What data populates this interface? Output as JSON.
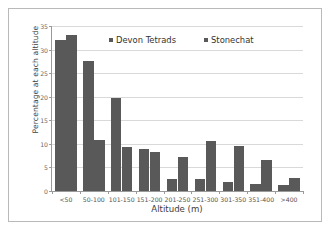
{
  "chart_data": {
    "type": "bar",
    "title": "",
    "subtitle": "",
    "xlabel": "Altitude (m)",
    "ylabel": "Percentage at each altitude",
    "categories": [
      "<50",
      "50-100",
      "101-150",
      "151-200",
      "201-250",
      "251-300",
      "301-350",
      "351-400",
      ">400"
    ],
    "series": [
      {
        "name": "Devon Tetrads",
        "color": "#595959",
        "values": [
          32.0,
          27.6,
          19.8,
          8.9,
          2.6,
          2.6,
          2.0,
          1.5,
          1.2
        ]
      },
      {
        "name": "Stonechat",
        "color": "#595959",
        "values": [
          33.0,
          10.8,
          9.3,
          8.2,
          7.2,
          10.6,
          9.6,
          6.5,
          2.7
        ]
      }
    ],
    "ylim": [
      0,
      35
    ],
    "yticks": [
      0,
      5,
      10,
      15,
      20,
      25,
      30,
      35
    ],
    "ytick_labels": [
      "0",
      "5",
      "10",
      "15",
      "20",
      "25",
      "30",
      "35"
    ],
    "grid": "horizontal",
    "legend_position": "top-center"
  },
  "legend": {
    "entries": [
      {
        "label": "Devon Tetrads",
        "swatch": "legend-swatch-devon-tetrads"
      },
      {
        "label": "Stonechat",
        "swatch": "legend-swatch-stonechat"
      }
    ]
  },
  "axes": {
    "x_title": "Altitude (m)",
    "y_title": "Percentage at each altitude"
  }
}
